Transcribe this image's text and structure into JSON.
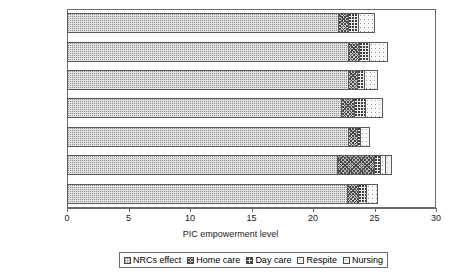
{
  "top_artifact": "",
  "chart_data": {
    "type": "bar",
    "orientation": "horizontal",
    "stacked": true,
    "title": "",
    "xlabel": "PIC empowerment level",
    "ylabel": "",
    "xlim": [
      0,
      30
    ],
    "xticks": [
      0,
      5,
      10,
      15,
      20,
      25,
      30
    ],
    "xtick_labels": [
      "0",
      "5",
      "10",
      "15",
      "20",
      "25",
      "30"
    ],
    "grid": false,
    "legend_position": "bottom",
    "categories": [
      "Sev cog imp",
      "Mild cog imp",
      "No cog imp",
      "Critical",
      "Short",
      "Long",
      "Overall"
    ],
    "series": [
      {
        "name": "NRCs effect",
        "pattern": "fine-dotted",
        "values": [
          22.2,
          23.0,
          23.0,
          22.4,
          23.0,
          22.1,
          22.9
        ]
      },
      {
        "name": "Home care",
        "pattern": "cross-hatch",
        "values": [
          0.8,
          0.9,
          0.7,
          1.1,
          0.7,
          3.0,
          0.9
        ]
      },
      {
        "name": "Day care",
        "pattern": "coarse-dotted",
        "values": [
          0.8,
          0.8,
          0.6,
          0.9,
          0.3,
          0.5,
          0.7
        ]
      },
      {
        "name": "Respite",
        "pattern": "sparse-dotted",
        "values": [
          1.2,
          1.4,
          1.0,
          1.3,
          0.6,
          0.4,
          0.8
        ]
      },
      {
        "name": "Nursing",
        "pattern": "very-sparse-dotted",
        "values": [
          0.0,
          0.0,
          0.0,
          0.0,
          0.0,
          0.4,
          0.0
        ]
      }
    ],
    "totals": [
      25.0,
      26.1,
      25.3,
      25.7,
      24.6,
      26.4,
      25.3
    ]
  },
  "legend": {
    "items": [
      {
        "label": "NRCs effect"
      },
      {
        "label": "Home care"
      },
      {
        "label": "Day care"
      },
      {
        "label": "Respite"
      },
      {
        "label": "Nursing"
      }
    ]
  }
}
